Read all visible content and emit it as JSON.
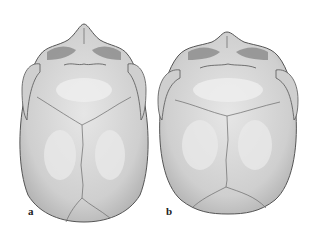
{
  "figure": {
    "panels": [
      {
        "id": "a",
        "label": "a",
        "description": "skull-top-view-narrow"
      },
      {
        "id": "b",
        "label": "b",
        "description": "skull-top-view-wide"
      }
    ],
    "colors": {
      "bone": "#d2d2d2",
      "bone_highlight": "#ececec",
      "outline": "#555555",
      "suture": "#6a6a6a",
      "orbit": "#8a8a8a"
    }
  }
}
